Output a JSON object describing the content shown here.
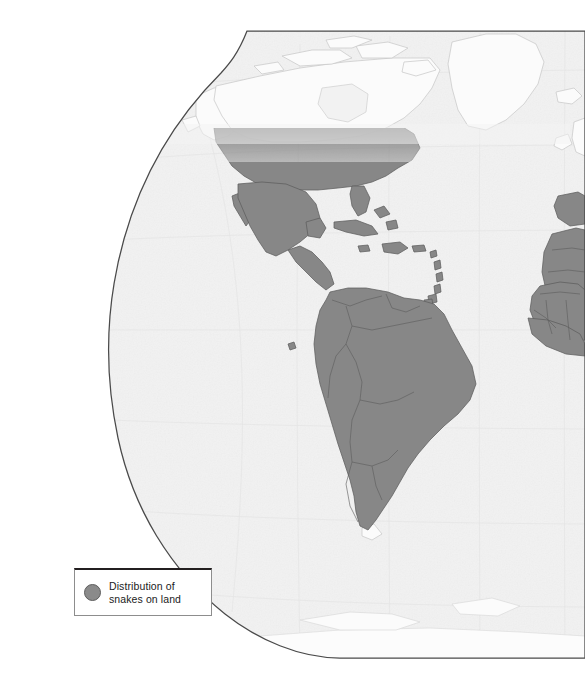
{
  "figure": {
    "kind": "world-distribution-map",
    "projection": "robinson",
    "hemisphere_shown": "western",
    "background_color": "#ffffff",
    "ocean_color": "#f2f2f2",
    "graticule_color": "#e2e2e2",
    "border_color": "#4a4a4a",
    "coastline_unshaded_color": "#c8c8c8",
    "distribution_fill": "#878787",
    "distribution_outline": "#5e5e5e",
    "fade_band_note": "dithered gradient across southern Canada marking northern limit"
  },
  "legend": {
    "swatch_icon": "filled-circle-icon",
    "swatch_color": "#8a8a8a",
    "swatch_outline_color": "#5d5d5d",
    "label": "Distribution of\nsnakes on land",
    "border_top_color": "#231f20",
    "border_side_color": "#8d8d8d"
  },
  "caption": {
    "text": ""
  },
  "regions_shaded": [
    "United States (south of fade band)",
    "Mexico",
    "Central America",
    "Caribbean islands",
    "Cuba",
    "Hispaniola",
    "Jamaica",
    "Puerto Rico",
    "Lesser Antilles",
    "Colombia",
    "Venezuela",
    "Guyana",
    "Suriname",
    "French Guiana",
    "Ecuador",
    "Peru",
    "Brazil",
    "Bolivia",
    "Paraguay",
    "Uruguay",
    "Chile",
    "Argentina",
    "Galapagos Islands",
    "Iberian Peninsula",
    "North Africa",
    "West Africa",
    "Ireland edge (unshaded)",
    "Britain edge (unshaded)"
  ],
  "regions_unshaded": [
    "Greenland",
    "Arctic Canada",
    "Alaska",
    "Iceland",
    "Northern Canada",
    "Tierra del Fuego (southern tip)",
    "Antarctica",
    "Ireland",
    "Great Britain"
  ]
}
